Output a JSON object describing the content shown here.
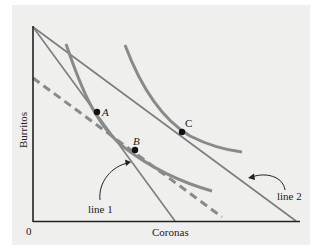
{
  "diagram": {
    "type": "indifference-curve-budget-lines",
    "axes": {
      "xlabel": "Coronas",
      "ylabel": "Burritos",
      "origin_label": "0"
    },
    "lines": [
      {
        "id": "line1",
        "label": "line 1",
        "description": "steeper budget line, tangent to lower indifference curve at B"
      },
      {
        "id": "line2",
        "label": "line 2",
        "description": "flatter budget line, tangent to higher indifference curve at C"
      },
      {
        "id": "dashed",
        "label": "",
        "description": "dashed line parallel to line 2, tangent at B region"
      }
    ],
    "points": [
      {
        "label": "A"
      },
      {
        "label": "B"
      },
      {
        "label": "C"
      }
    ],
    "colors": {
      "background_panel": "#efefee",
      "axis": "#222222",
      "curves": "#8a8a8a",
      "budget_lines": "#7d7d7d",
      "points": "#111111"
    }
  }
}
